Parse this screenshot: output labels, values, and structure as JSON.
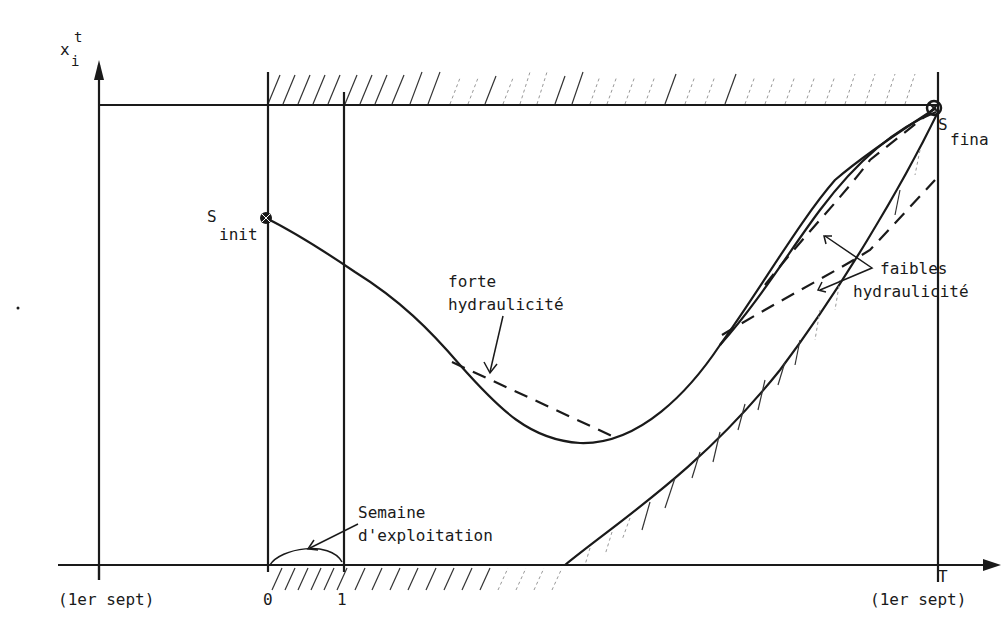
{
  "axes": {
    "y_label": "x",
    "y_label_sup": "t",
    "y_label_sub": "i",
    "x_tick_start": "(1er sept)",
    "x_tick_0": "0",
    "x_tick_1": "1",
    "x_tick_T": "T",
    "x_tick_end": "(1er sept)"
  },
  "points": {
    "s_init": "S",
    "s_init_sub": "init",
    "s_final": "S",
    "s_final_sub": "fina"
  },
  "annotations": {
    "forte_line1": "forte",
    "forte_line2": "hydraulicité",
    "faibles_line1": "faibles",
    "faibles_line2": "hydraulicité",
    "semaine_line1": "Semaine",
    "semaine_line2": "d'exploitation"
  },
  "colors": {
    "ink": "#1a1a1a",
    "paper": "#ffffff"
  }
}
